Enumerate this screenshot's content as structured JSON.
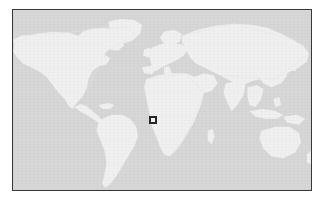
{
  "figure": {
    "kind": "world-locator-map",
    "projection": "equirectangular",
    "alt_text": "World map with a small square marker over West Africa (Gulf of Guinea)"
  },
  "frame": {
    "border_color": "#383838",
    "border_width_px": 1,
    "x": 12,
    "y": 9,
    "width": 300,
    "height": 182
  },
  "colors": {
    "page_background": "#ffffff",
    "ocean": "#d7d7d7",
    "land": "#f0f0f0",
    "land_shadow": "#e4e4e4",
    "marker_outline": "#262626",
    "marker_fill": "#f2f2f2"
  },
  "map": {
    "view_extent": {
      "west_longitude": -180,
      "east_longitude": 180,
      "north_latitude": 84,
      "south_latitude": -60
    },
    "landmasses": [
      "North America",
      "Greenland",
      "South America",
      "Europe",
      "Africa",
      "Asia",
      "Australia",
      "Southeast Asian islands",
      "Japan",
      "British Isles",
      "Madagascar",
      "New Zealand"
    ]
  },
  "marker": {
    "label": "location-marker",
    "shape": "square-outline",
    "region": "West Africa / Gulf of Guinea",
    "approx_longitude": 6,
    "approx_latitude": 6,
    "pixel_x": 153,
    "pixel_y": 120,
    "size_px": 8
  }
}
